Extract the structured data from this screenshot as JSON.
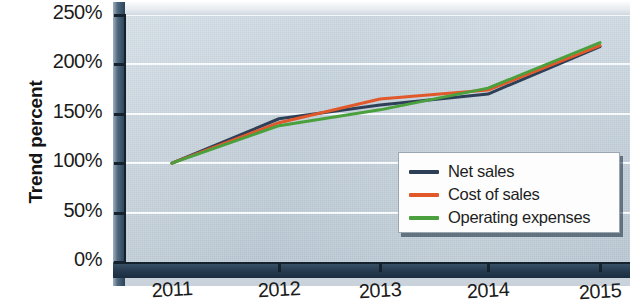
{
  "chart_data": {
    "type": "line",
    "title": "",
    "xlabel": "",
    "ylabel": "Trend percent",
    "categories": [
      "2011",
      "2012",
      "2013",
      "2014",
      "2015"
    ],
    "x": [
      2011,
      2012,
      2013,
      2014,
      2015
    ],
    "ylim": [
      0,
      250
    ],
    "ytick_values": [
      0,
      50,
      100,
      150,
      200,
      250
    ],
    "ytick_labels": [
      "0%",
      "50%",
      "100%",
      "150%",
      "200%",
      "250%"
    ],
    "grid": true,
    "legend_position": "bottom-right",
    "series": [
      {
        "name": "Net sales",
        "color": "#2e4057",
        "values": [
          100,
          145,
          159,
          170,
          218
        ]
      },
      {
        "name": "Cost of sales",
        "color": "#e1582b",
        "values": [
          100,
          141,
          165,
          174,
          219
        ]
      },
      {
        "name": "Operating expenses",
        "color": "#4aa03c",
        "values": [
          100,
          138,
          154,
          176,
          222
        ]
      }
    ]
  },
  "axes": {
    "y_title": "Trend percent",
    "y_labels": [
      "250%",
      "200%",
      "150%",
      "100%",
      "50%",
      "0%"
    ],
    "x_labels": [
      "2011",
      "2012",
      "2013",
      "2014",
      "2015"
    ]
  },
  "legend": {
    "items": [
      {
        "label": "Net sales",
        "color": "#2e4057"
      },
      {
        "label": "Cost of sales",
        "color": "#e1582b"
      },
      {
        "label": "Operating expenses",
        "color": "#4aa03c"
      }
    ]
  },
  "style": {
    "plot_background": "#c3d0da",
    "frame_dark": "#24394d",
    "gridline_color": "#ffffff",
    "axis_color": "#14222e",
    "text_color": "#1b1b1b"
  }
}
